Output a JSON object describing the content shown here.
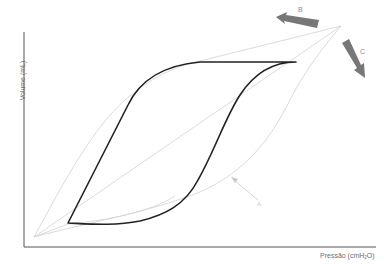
{
  "figure": {
    "type": "pressure-volume-loop",
    "y_axis_label": "Volume (mL)",
    "x_axis_label_main": "Pressão (cmH",
    "x_axis_label_sub": "2",
    "x_axis_label_end": "O)",
    "annotations": [
      {
        "id": "A",
        "label": "A",
        "kind": "thin-arrow",
        "color": "#c8c8c8"
      },
      {
        "id": "B",
        "label": "B",
        "kind": "thick-arrow",
        "direction": "left",
        "color": "#777777"
      },
      {
        "id": "C",
        "label": "C",
        "kind": "thick-arrow",
        "direction": "down-right",
        "color": "#777777"
      }
    ],
    "colors": {
      "axis": "#555555",
      "loop": "#222222",
      "reference_lines": "#cfcfcf",
      "thick_arrows": "#777777",
      "thin_arrow": "#c8c8c8",
      "labels": "#6e6e6e"
    },
    "curves": [
      {
        "name": "hysteresis-loop",
        "style": "thick-dark"
      },
      {
        "name": "upper-reference-curve",
        "style": "thin-grey"
      },
      {
        "name": "straight-reference-line",
        "style": "thin-grey"
      },
      {
        "name": "lower-reference-curve",
        "style": "thin-grey"
      }
    ]
  }
}
